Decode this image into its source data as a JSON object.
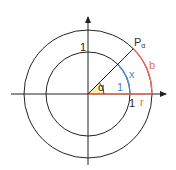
{
  "diagram": {
    "labels": {
      "point": "P",
      "point_subscript": "α",
      "alpha": "α",
      "inner_radius": "1",
      "inner_arc": "x",
      "outer_arc": "b",
      "outer_radius": "r",
      "y_tick": "1",
      "x_tick": "1"
    },
    "colors": {
      "axes": "#222222",
      "circles": "#222222",
      "blue_arc": "#4a86c8",
      "red": "#e8705a",
      "angle_fill": "#f7efb0"
    }
  }
}
